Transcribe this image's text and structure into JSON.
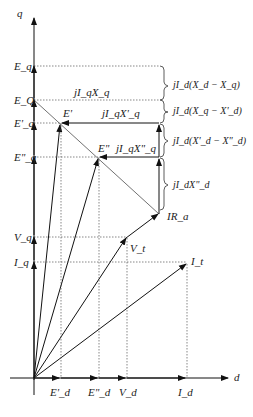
{
  "diagram": {
    "axes": {
      "q": "q",
      "d": "d"
    },
    "q_axis_labels": {
      "Eq": "E_q",
      "EQ": "E_Q",
      "Epq": "E'_q",
      "Eppq": "E\"_q",
      "Vq": "V_q",
      "Iq": "I_q"
    },
    "d_axis_labels": {
      "Epd": "E'_d",
      "Eppd": "E\"_d",
      "Vd": "V_d",
      "Id": "I_d"
    },
    "phasor_labels": {
      "Ep": "E'",
      "Epp": "E\"",
      "Vt": "V_t",
      "It": "I_t",
      "IRa": "IR_a"
    },
    "drop_labels": {
      "jIqXq": "jI_qX_q",
      "jIqXpq": "jI_qX'_q",
      "jIqXppq": "jI_qX\"_q"
    },
    "brace_labels": {
      "b1": "jI_d(X_d − X_q)",
      "b2": "jI_d(X_q − X'_d)",
      "b3": "jI_d(X'_d − X\"_d)",
      "b4": "jI_dX\"_d"
    }
  }
}
